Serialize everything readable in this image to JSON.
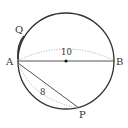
{
  "diagram": {
    "type": "geometry",
    "circle": {
      "cx": 66,
      "cy": 61,
      "r": 48,
      "stroke": "#333333"
    },
    "points": {
      "A": {
        "label": "A",
        "x": 17,
        "y": 61
      },
      "B": {
        "label": "B",
        "x": 115,
        "y": 61
      },
      "P": {
        "label": "P",
        "x": 79,
        "y": 108
      },
      "Q": {
        "label": "Q",
        "x": 22,
        "y": 33
      },
      "O": {
        "x": 66,
        "y": 61
      }
    },
    "measures": {
      "AB": "10",
      "AP": "8"
    },
    "colors": {
      "line": "#333333",
      "dotted": "#aaaaaa"
    }
  }
}
